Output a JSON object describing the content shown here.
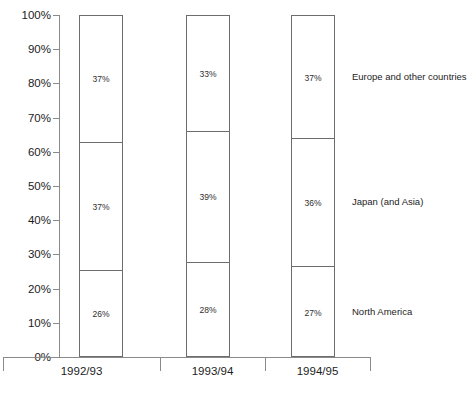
{
  "chart_data": {
    "type": "bar",
    "subtype": "stacked-100-percent",
    "title": "",
    "xlabel": "",
    "ylabel": "",
    "ylim": [
      0,
      100
    ],
    "grid": false,
    "legend_position": "right",
    "categories": [
      "1992/93",
      "1993/94",
      "1994/95"
    ],
    "y_ticks": [
      "0%",
      "10%",
      "20%",
      "30%",
      "40%",
      "50%",
      "60%",
      "70%",
      "80%",
      "90%",
      "100%"
    ],
    "y_tick_values": [
      0,
      10,
      20,
      30,
      40,
      50,
      60,
      70,
      80,
      90,
      100
    ],
    "series": [
      {
        "name": "North America",
        "values": [
          26,
          28,
          27
        ],
        "labels": [
          "26%",
          "28%",
          "27%"
        ]
      },
      {
        "name": "Japan (and Asia)",
        "values": [
          37,
          39,
          36
        ],
        "labels": [
          "37%",
          "39%",
          "36%"
        ]
      },
      {
        "name": "Europe and other countries",
        "values": [
          37,
          33,
          37
        ],
        "labels": [
          "37%",
          "33%",
          "37%"
        ]
      }
    ],
    "segment_boundaries": [
      [
        25.5,
        63.0
      ],
      [
        27.8,
        66.2
      ],
      [
        26.5,
        64.0
      ]
    ],
    "colors": {
      "bar_fill": "#ffffff",
      "bar_stroke": "#6d6d6d",
      "axis": "#8a8a8a",
      "text": "#1c1c1c",
      "background": "#ffffff"
    }
  },
  "legend": {
    "entries": [
      {
        "label": "Europe and other countries"
      },
      {
        "label": "Japan (and Asia)"
      },
      {
        "label": "North America"
      }
    ]
  }
}
